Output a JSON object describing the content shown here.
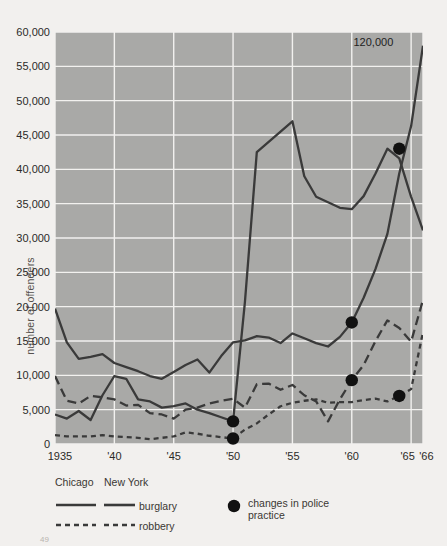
{
  "axes": {
    "ylabel": "number of offenders",
    "yticks": [
      "0",
      "5,000",
      "10,000",
      "15,000",
      "20,000",
      "25,000",
      "30,000",
      "35,000",
      "40,000",
      "45,000",
      "50,000",
      "55,000",
      "60,000"
    ],
    "ytick_values": [
      0,
      5000,
      10000,
      15000,
      20000,
      25000,
      30000,
      35000,
      40000,
      45000,
      50000,
      55000,
      60000
    ],
    "xticks": [
      {
        "label": "1935",
        "year": 1935
      },
      {
        "label": "'40",
        "year": 1940
      },
      {
        "label": "'45",
        "year": 1945
      },
      {
        "label": "'50",
        "year": 1950
      },
      {
        "label": "'55",
        "year": 1955
      },
      {
        "label": "'60",
        "year": 1960
      },
      {
        "label": "'65",
        "year": 1965
      },
      {
        "label": "'66",
        "year": 1966
      }
    ]
  },
  "annotations": [
    {
      "text": "120,000",
      "year": 1964.0,
      "value": 58300
    }
  ],
  "legend": {
    "col1_header": "Chicago",
    "col2_header": "New York",
    "row1_label": "burglary",
    "row2_label": "robbery",
    "marker_label_line1": "changes in police",
    "marker_label_line2": "practice"
  },
  "colors": {
    "plot_background": "#a9a9a7",
    "gridline": "#f2f1ef",
    "line": "#3a3a3a",
    "marker": "#111111",
    "page_background": "#f2f0ee",
    "text": "#2b2a28"
  },
  "page_number": "49",
  "chart_data": {
    "type": "line",
    "title": "",
    "xlabel": "",
    "ylabel": "number of offenders",
    "xlim": [
      1935,
      1966
    ],
    "ylim": [
      0,
      60000
    ],
    "grid": true,
    "legend_position": "below",
    "x": [
      1935,
      1936,
      1937,
      1938,
      1939,
      1940,
      1941,
      1942,
      1943,
      1944,
      1945,
      1946,
      1947,
      1948,
      1949,
      1950,
      1951,
      1952,
      1953,
      1954,
      1955,
      1956,
      1957,
      1958,
      1959,
      1960,
      1961,
      1962,
      1963,
      1964,
      1965,
      1966
    ],
    "series": [
      {
        "name": "New York burglary",
        "city": "New York",
        "offense": "burglary",
        "style": "solid",
        "values": [
          19700,
          14800,
          12400,
          12700,
          13100,
          11800,
          11200,
          10600,
          9900,
          9500,
          10500,
          11500,
          12300,
          10400,
          12800,
          14800,
          15100,
          15700,
          15500,
          14700,
          16100,
          15400,
          14700,
          14200,
          15600,
          17700,
          21300,
          25500,
          30600,
          39400,
          46300,
          58000
        ]
      },
      {
        "name": "Chicago burglary",
        "city": "Chicago",
        "offense": "burglary",
        "style": "solid",
        "values": [
          4300,
          3700,
          4800,
          3500,
          7100,
          9900,
          9500,
          6500,
          6200,
          5300,
          5500,
          5900,
          5000,
          4500,
          3900,
          3300,
          20700,
          42500,
          44000,
          45500,
          47000,
          39000,
          36000,
          35200,
          34400,
          34200,
          36100,
          39400,
          43000,
          41600,
          36000,
          31100
        ]
      },
      {
        "name": "New York robbery",
        "city": "New York",
        "offense": "robbery",
        "style": "dashed",
        "values": [
          9900,
          6300,
          5900,
          7000,
          6800,
          6500,
          5600,
          5700,
          4500,
          4300,
          3700,
          5000,
          5300,
          5900,
          6300,
          6600,
          5300,
          8700,
          8800,
          7900,
          8600,
          7100,
          6200,
          3300,
          6500,
          9300,
          11500,
          15000,
          18000,
          16900,
          14900,
          21000
        ]
      },
      {
        "name": "Chicago robbery",
        "city": "Chicago",
        "offense": "robbery",
        "style": "dotted",
        "values": [
          1300,
          1100,
          1100,
          1100,
          1300,
          1100,
          1000,
          900,
          700,
          900,
          1100,
          1700,
          1500,
          1200,
          1000,
          800,
          2100,
          3000,
          4300,
          5500,
          6000,
          6300,
          6500,
          6000,
          6100,
          6100,
          6400,
          6600,
          6200,
          7000,
          8000,
          16300
        ]
      }
    ],
    "markers": [
      {
        "label": "change in police practice",
        "year": 1950,
        "value": 3300,
        "series": "Chicago burglary"
      },
      {
        "label": "change in police practice",
        "year": 1950,
        "value": 800,
        "series": "Chicago robbery"
      },
      {
        "label": "change in police practice",
        "year": 1960,
        "value": 17700,
        "series": "New York burglary"
      },
      {
        "label": "change in police practice",
        "year": 1960,
        "value": 9300,
        "series": "New York robbery"
      },
      {
        "label": "change in police practice",
        "year": 1964,
        "value": 43000,
        "series": "Chicago burglary"
      },
      {
        "label": "change in police practice",
        "year": 1964,
        "value": 7000,
        "series": "Chicago robbery"
      }
    ]
  }
}
